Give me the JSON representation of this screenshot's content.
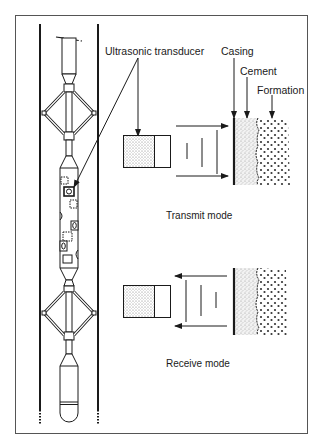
{
  "figure": {
    "type": "diagram",
    "labels": {
      "transducer": "Ultrasonic transducer",
      "casing": "Casing",
      "cement": "Cement",
      "formation": "Formation"
    },
    "panels": [
      {
        "id": "transmit",
        "caption": "Transmit mode",
        "arrow_direction": "right"
      },
      {
        "id": "receive",
        "caption": "Receive mode",
        "arrow_direction": "left"
      }
    ],
    "colors": {
      "ink": "#1a1a1a",
      "frame": "#555555",
      "background": "#ffffff",
      "stipple": "#888888"
    }
  }
}
